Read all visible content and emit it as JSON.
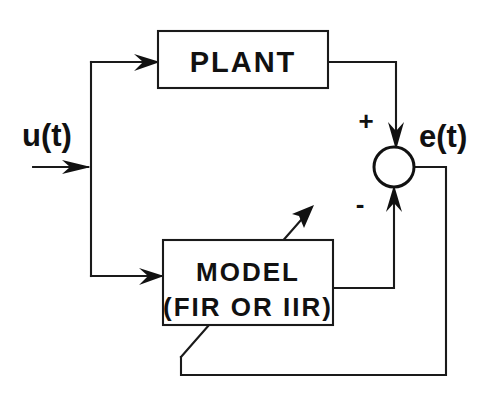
{
  "diagram": {
    "type": "system-identification-block-diagram",
    "blocks": [
      {
        "id": "plant",
        "label": "PLANT"
      },
      {
        "id": "model",
        "label_line1": "MODEL",
        "label_line2": "(FIR OR IIR)"
      }
    ],
    "signals": {
      "input_label": "u(t)",
      "error_label": "e(t)"
    },
    "summing_junction": {
      "plus_label": "+",
      "minus_label": "-"
    },
    "colors": {
      "ink": "#1a1a1a",
      "background": "#ffffff"
    }
  }
}
